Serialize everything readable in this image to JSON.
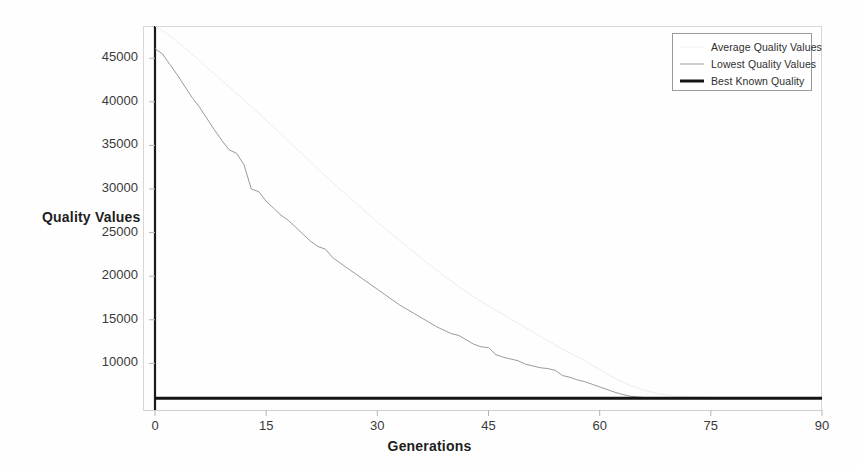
{
  "chart_data": {
    "type": "line",
    "title": "",
    "subtitle": "",
    "xlabel": "Generations",
    "ylabel": "Quality Values",
    "xlim": [
      0,
      90
    ],
    "ylim": [
      4650,
      48700
    ],
    "grid": false,
    "legend_position": "top-right",
    "xticks": [
      0,
      15,
      30,
      45,
      60,
      75,
      90
    ],
    "xtick_labels": [
      "0",
      "15",
      "30",
      "45",
      "60",
      "75",
      "90"
    ],
    "yticks": [
      10000,
      15000,
      20000,
      25000,
      30000,
      35000,
      40000,
      45000
    ],
    "ytick_labels": [
      "10000",
      "15000",
      "20000",
      "25000",
      "30000",
      "35000",
      "40000",
      "45000"
    ],
    "series": [
      {
        "name": "Average Quality Values",
        "color": "#ededed",
        "width": 1,
        "x": [
          0,
          2,
          4,
          6,
          8,
          10,
          12,
          14,
          16,
          18,
          20,
          22,
          24,
          26,
          28,
          30,
          32,
          34,
          36,
          38,
          40,
          42,
          44,
          46,
          48,
          50,
          52,
          54,
          56,
          58,
          60,
          62,
          64,
          66,
          68,
          70,
          75,
          80,
          85,
          90
        ],
        "values": [
          48700,
          47600,
          46200,
          44700,
          43200,
          41700,
          40200,
          38700,
          37100,
          35500,
          33900,
          32300,
          30700,
          29200,
          27700,
          26200,
          24800,
          23400,
          22000,
          20700,
          19400,
          18200,
          17100,
          16100,
          15100,
          14100,
          13100,
          12100,
          11200,
          10300,
          9300,
          8300,
          7500,
          6900,
          6500,
          6250,
          6080,
          6040,
          6020,
          6010
        ]
      },
      {
        "name": "Lowest Quality Values",
        "color": "#9a9a9a",
        "width": 1,
        "x": [
          0,
          1,
          2,
          3,
          4,
          5,
          6,
          7,
          8,
          9,
          10,
          11,
          12,
          13,
          14,
          15,
          16,
          17,
          18,
          19,
          20,
          21,
          22,
          23,
          24,
          25,
          26,
          27,
          28,
          29,
          30,
          31,
          32,
          33,
          34,
          35,
          36,
          37,
          38,
          39,
          40,
          41,
          42,
          43,
          44,
          45,
          46,
          47,
          48,
          49,
          50,
          51,
          52,
          53,
          54,
          55,
          56,
          57,
          58,
          59,
          60,
          61,
          62,
          63,
          64,
          65,
          66,
          68,
          70,
          72,
          75,
          80,
          85,
          90
        ],
        "values": [
          46100,
          45500,
          44300,
          43100,
          41800,
          40500,
          39400,
          38100,
          36800,
          35600,
          34500,
          34100,
          32800,
          30000,
          29700,
          28600,
          27800,
          27000,
          26400,
          25600,
          24800,
          24000,
          23400,
          23100,
          22100,
          21500,
          20900,
          20300,
          19700,
          19100,
          18500,
          17900,
          17300,
          16700,
          16200,
          15700,
          15200,
          14700,
          14200,
          13800,
          13400,
          13200,
          12700,
          12200,
          11900,
          11800,
          11000,
          10700,
          10500,
          10300,
          9900,
          9700,
          9500,
          9400,
          9200,
          8600,
          8400,
          8100,
          7900,
          7600,
          7300,
          7000,
          6700,
          6450,
          6250,
          6150,
          6080,
          6040,
          6020,
          6010,
          6000,
          6000,
          6000,
          6000
        ]
      },
      {
        "name": "Best Known Quality",
        "color": "#141414",
        "width": 3,
        "x": [
          0,
          90
        ],
        "values": [
          6000,
          6000
        ]
      }
    ]
  },
  "legend": {
    "items": [
      {
        "label": "Average Quality Values",
        "swatch": "line-light"
      },
      {
        "label": "Lowest Quality Values",
        "swatch": "line-gray"
      },
      {
        "label": "Best Known Quality",
        "swatch": "line-black-thick"
      }
    ]
  },
  "axes": {
    "x_title": "Generations",
    "y_title": "Quality Values",
    "x_tick_labels": [
      "0",
      "15",
      "30",
      "45",
      "60",
      "75",
      "90"
    ],
    "y_tick_labels": [
      "45000",
      "40000",
      "35000",
      "30000",
      "25000",
      "20000",
      "15000",
      "10000"
    ]
  }
}
